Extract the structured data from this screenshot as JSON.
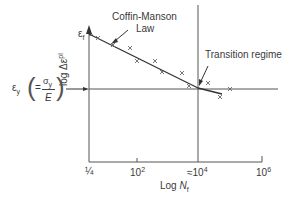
{
  "diagram": {
    "y_axis_label_prefix": "log Δε",
    "y_axis_label_sup": "pl",
    "x_axis_label_prefix": "Log ",
    "x_axis_label_var": "N",
    "x_axis_label_sub": "f",
    "ef_label": "ε",
    "ef_sub": "f",
    "ey_label": "ε",
    "ey_sub": "y",
    "ey_eq": "=",
    "ey_num": "σ",
    "ey_num_sub": "y",
    "ey_den": "E",
    "coffin_line1": "Coffin-Manson",
    "coffin_line2": "Law",
    "transition_label": "Transition regime",
    "x_ticks": [
      {
        "label": "¼"
      },
      {
        "label": "10",
        "sup": "2"
      },
      {
        "label": "≈10",
        "sup": "4"
      },
      {
        "label": "10",
        "sup": "6"
      }
    ]
  }
}
